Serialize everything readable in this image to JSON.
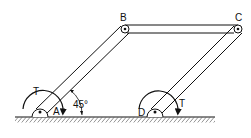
{
  "diagram": {
    "points": {
      "A": {
        "label": "A"
      },
      "B": {
        "label": "B"
      },
      "C": {
        "label": "C"
      },
      "D": {
        "label": "D"
      }
    },
    "torque_labels": {
      "left": "T",
      "right": "T"
    },
    "angle_label": "45°",
    "colors": {
      "stroke": "#111111",
      "background": "#ffffff"
    }
  }
}
